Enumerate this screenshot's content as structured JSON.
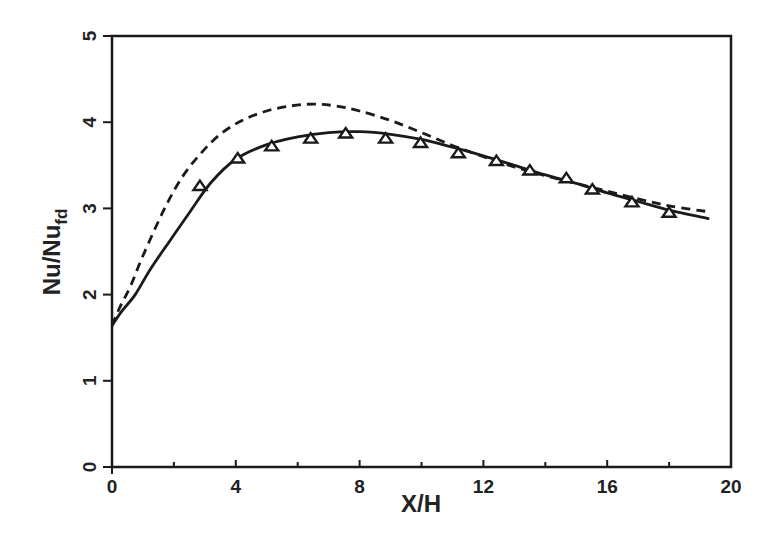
{
  "chart_data": {
    "type": "line",
    "title": "",
    "xlabel": "X/H",
    "ylabel": "Nu/Nu_fd",
    "ylabel_main": "Nu/Nu",
    "ylabel_sub": "fd",
    "xlim": [
      0,
      20
    ],
    "ylim": [
      0,
      5
    ],
    "xticks": [
      0,
      4,
      8,
      12,
      16,
      20
    ],
    "yticks": [
      0,
      1,
      2,
      3,
      4,
      5
    ],
    "xtick_labels": [
      "0",
      "4",
      "8",
      "12",
      "16",
      "20"
    ],
    "ytick_labels": [
      "0",
      "1",
      "2",
      "3",
      "4",
      "5"
    ],
    "grid": false,
    "legend": null,
    "series": [
      {
        "name": "solid curve",
        "style": "solid",
        "color": "#1a1a1a",
        "x": [
          0,
          0.3,
          0.75,
          1.25,
          1.9,
          2.5,
          3.2,
          4.0,
          5.0,
          6.0,
          7.0,
          8.0,
          9.0,
          10.0,
          11.0,
          12.0,
          13.0,
          14.0,
          15.0,
          16.0,
          17.0,
          18.0,
          19.3
        ],
        "y": [
          1.64,
          1.8,
          2.0,
          2.3,
          2.64,
          2.95,
          3.3,
          3.57,
          3.74,
          3.83,
          3.88,
          3.89,
          3.86,
          3.8,
          3.71,
          3.61,
          3.5,
          3.39,
          3.29,
          3.18,
          3.08,
          2.98,
          2.88
        ]
      },
      {
        "name": "dashed curve",
        "style": "dashed",
        "color": "#1a1a1a",
        "x": [
          0,
          0.25,
          0.6,
          1.0,
          1.7,
          2.3,
          2.9,
          3.5,
          4.2,
          5.0,
          5.8,
          6.5,
          7.2,
          8.0,
          9.0,
          10.0,
          11.0,
          12.0,
          13.0,
          14.0,
          15.0,
          16.0,
          17.0,
          18.0,
          19.3
        ],
        "y": [
          1.64,
          1.85,
          2.1,
          2.45,
          3.0,
          3.38,
          3.65,
          3.86,
          4.02,
          4.13,
          4.19,
          4.21,
          4.19,
          4.13,
          4.02,
          3.88,
          3.73,
          3.6,
          3.48,
          3.38,
          3.29,
          3.2,
          3.11,
          3.03,
          2.96
        ]
      },
      {
        "name": "experimental data",
        "style": "markers",
        "marker": "triangle-open",
        "color": "#1a1a1a",
        "x": [
          2.84,
          4.06,
          5.16,
          6.42,
          7.55,
          8.84,
          9.97,
          11.19,
          12.42,
          13.5,
          14.68,
          15.52,
          16.8,
          18.0
        ],
        "y": [
          3.26,
          3.58,
          3.72,
          3.81,
          3.87,
          3.81,
          3.76,
          3.64,
          3.55,
          3.44,
          3.35,
          3.22,
          3.07,
          2.95
        ]
      }
    ]
  },
  "layout": {
    "plot_left": 112,
    "plot_top": 36,
    "plot_right": 731,
    "plot_bottom": 467
  }
}
